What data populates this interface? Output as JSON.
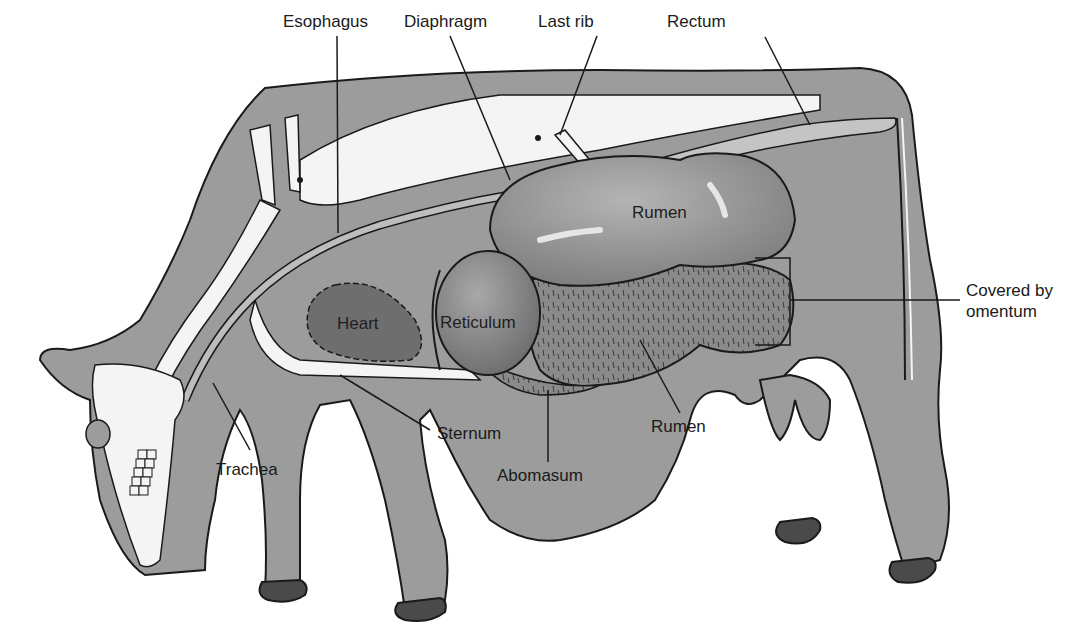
{
  "figure": {
    "colors": {
      "body": "#9c9c9c",
      "body_outline": "#1a1a1a",
      "bone": "#f4f4f4",
      "organ_light": "#8e8e8e",
      "organ_dark": "#6f6f6f",
      "heart": "#6e6e6e",
      "hoof": "#4a4a4a",
      "background": "#ffffff"
    }
  },
  "labels": {
    "esophagus": "Esophagus",
    "diaphragm": "Diaphragm",
    "last_rib": "Last rib",
    "rectum": "Rectum",
    "rumen_upper": "Rumen",
    "covered_by_omentum": "Covered by\nomentum",
    "heart": "Heart",
    "reticulum": "Reticulum",
    "sternum": "Sternum",
    "trachea": "Trachea",
    "abomasum": "Abomasum",
    "rumen_lower": "Rumen"
  }
}
